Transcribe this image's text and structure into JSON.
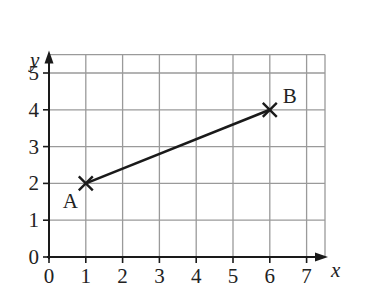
{
  "chart_data": {
    "type": "line",
    "title": "",
    "xlabel": "x",
    "ylabel": "y",
    "xlim": [
      0,
      7.5
    ],
    "ylim": [
      0,
      5.5
    ],
    "x_ticks": [
      "0",
      "1",
      "2",
      "3",
      "4",
      "5",
      "6",
      "7"
    ],
    "y_ticks": [
      "0",
      "1",
      "2",
      "3",
      "4",
      "5"
    ],
    "grid": true,
    "points": [
      {
        "label": "A",
        "x": 1,
        "y": 2
      },
      {
        "label": "B",
        "x": 6,
        "y": 4
      }
    ],
    "series": [
      {
        "name": "AB",
        "x": [
          1,
          6
        ],
        "y": [
          2,
          4
        ]
      }
    ]
  },
  "colors": {
    "grid": "#9a9a9a",
    "axis": "#1a1a1a",
    "line": "#1a1a1a"
  }
}
